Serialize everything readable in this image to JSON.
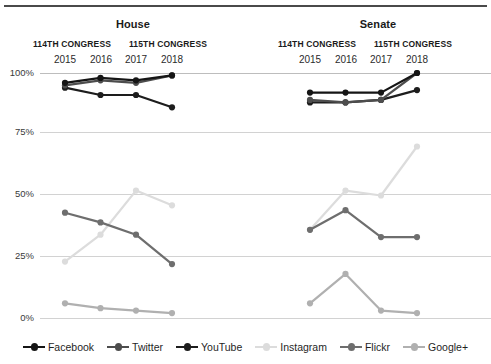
{
  "chart_data": {
    "type": "line",
    "title": "",
    "xlabel": "",
    "ylabel": "",
    "ylim": [
      0,
      100
    ],
    "grid": true,
    "legend_position": "bottom",
    "yticks": [
      "0%",
      "25%",
      "50%",
      "75%",
      "100%"
    ],
    "ytick_values": [
      0,
      25,
      50,
      75,
      100
    ],
    "x": [
      "2015",
      "2016",
      "2017",
      "2018"
    ],
    "panels": [
      {
        "name": "House",
        "title": "House",
        "congress_groups": [
          {
            "label": "114TH CONGRESS",
            "years": [
              "2015",
              "2016"
            ]
          },
          {
            "label": "115TH CONGRESS",
            "years": [
              "2017",
              "2018"
            ]
          }
        ],
        "series": [
          {
            "name": "Facebook",
            "values": [
              96,
              98,
              97,
              99
            ]
          },
          {
            "name": "Twitter",
            "values": [
              95,
              97,
              96,
              99
            ]
          },
          {
            "name": "YouTube",
            "values": [
              94,
              91,
              91,
              86
            ]
          },
          {
            "name": "Instagram",
            "values": [
              23,
              34,
              52,
              46
            ]
          },
          {
            "name": "Flickr",
            "values": [
              43,
              39,
              34,
              22
            ]
          },
          {
            "name": "Google+",
            "values": [
              6,
              4,
              3,
              2
            ]
          }
        ]
      },
      {
        "name": "Senate",
        "title": "Senate",
        "congress_groups": [
          {
            "label": "114TH CONGRESS",
            "years": [
              "2015",
              "2016"
            ]
          },
          {
            "label": "115TH CONGRESS",
            "years": [
              "2017",
              "2018"
            ]
          }
        ],
        "series": [
          {
            "name": "Facebook",
            "values": [
              92,
              92,
              92,
              100
            ]
          },
          {
            "name": "Twitter",
            "values": [
              89,
              88,
              89,
              100
            ]
          },
          {
            "name": "YouTube",
            "values": [
              88,
              88,
              89,
              93
            ]
          },
          {
            "name": "Instagram",
            "values": [
              36,
              52,
              50,
              70
            ]
          },
          {
            "name": "Flickr",
            "values": [
              36,
              44,
              33,
              33
            ]
          },
          {
            "name": "Google+",
            "values": [
              6,
              18,
              3,
              2
            ]
          }
        ]
      }
    ],
    "legend": [
      {
        "label": "Facebook",
        "color": "#151515"
      },
      {
        "label": "Twitter",
        "color": "#4d4d4d"
      },
      {
        "label": "YouTube",
        "color": "#1d1d1d"
      },
      {
        "label": "Instagram",
        "color": "#dcdcdc"
      },
      {
        "label": "Flickr",
        "color": "#6e6e6e"
      },
      {
        "label": "Google+",
        "color": "#b0b0b0"
      }
    ],
    "colors": {
      "Facebook": "#151515",
      "Twitter": "#4d4d4d",
      "YouTube": "#1d1d1d",
      "Instagram": "#dcdcdc",
      "Flickr": "#6e6e6e",
      "Google+": "#b0b0b0"
    }
  }
}
